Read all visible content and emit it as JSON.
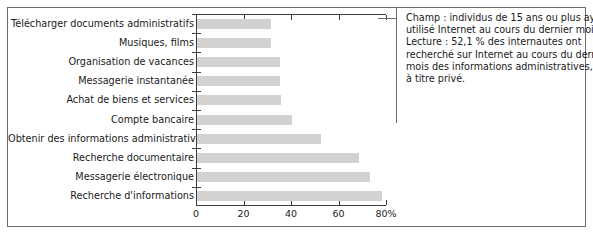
{
  "chart_data": {
    "type": "bar",
    "orientation": "horizontal",
    "title": "",
    "xlabel": "",
    "ylabel": "",
    "xlim": [
      0,
      80
    ],
    "xticks": [
      0,
      20,
      40,
      60,
      80
    ],
    "xtick_labels": [
      "0",
      "20",
      "40",
      "60",
      "80%"
    ],
    "grid": false,
    "legend": null,
    "bar_color": "#d2d2d2",
    "axis_color": "#3c3c3c",
    "categories": [
      "Télécharger documents administratifs",
      "Musiques, films",
      "Organisation de vacances",
      "Messagerie instantanée",
      "Achat de biens et services",
      "Compte bancaire",
      "Obtenir des informations administratives",
      "Recherche documentaire",
      "Messagerie électronique",
      "Recherche d'informations"
    ],
    "values": [
      31.0,
      31.0,
      35.0,
      35.0,
      35.5,
      40.0,
      52.1,
      68.0,
      73.0,
      78.0
    ]
  },
  "note": {
    "lines": [
      "Champ : individus de 15 ans ou plus ayant",
      "utilisé Internet au cours du dernier mois.",
      "Lecture : 52,1 % des internautes ont",
      "recherché sur Internet au cours du dernier",
      "mois des informations administratives,",
      "à titre privé."
    ]
  }
}
